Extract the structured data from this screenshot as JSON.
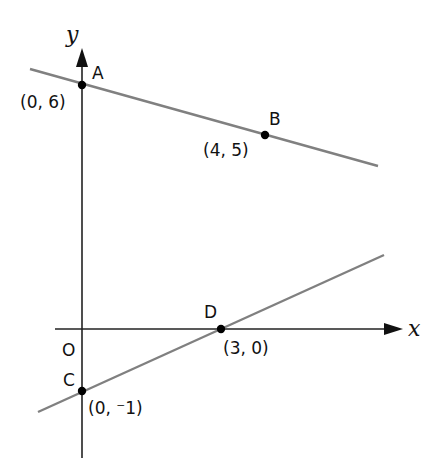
{
  "diagram": {
    "type": "coordinate-geometry",
    "axes": {
      "x_label": "x",
      "y_label": "y",
      "origin_label": "O"
    },
    "points": [
      {
        "name": "A",
        "coord_label": "(0, 6)",
        "x": 0,
        "y": 6
      },
      {
        "name": "B",
        "coord_label": "(4, 5)",
        "x": 4,
        "y": 5
      },
      {
        "name": "C",
        "coord_label": "(0, ⁻1)",
        "x": 0,
        "y": -1
      },
      {
        "name": "D",
        "coord_label": "(3, 0)",
        "x": 3,
        "y": 0
      }
    ],
    "lines": [
      {
        "name": "AB",
        "through": [
          "A",
          "B"
        ]
      },
      {
        "name": "CD",
        "through": [
          "C",
          "D"
        ]
      }
    ],
    "colors": {
      "axes": "#222222",
      "lines": "#808080",
      "points": "#000000"
    }
  }
}
